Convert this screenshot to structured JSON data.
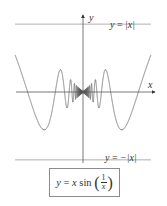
{
  "chart_data": {
    "type": "line",
    "title": "",
    "xlabel": "x",
    "ylabel": "y",
    "grid": false,
    "legend": "none",
    "series": [
      {
        "name": "y = x sin(1/x)",
        "function": "x*sin(1/x)",
        "color": "#666666",
        "style": "solid"
      },
      {
        "name": "y = |x|",
        "function": "abs(x)",
        "color": "#8c8c8c",
        "style": "solid"
      },
      {
        "name": "y = -|x|",
        "function": "-abs(x)",
        "color": "#8c8c8c",
        "style": "solid"
      }
    ],
    "xlim": [
      -0.39,
      0.39
    ],
    "ylim": [
      -0.41,
      0.44
    ],
    "annotations": [
      {
        "text": "y = |x|",
        "position": "upper-right"
      },
      {
        "text": "y = −|x|",
        "position": "lower-right"
      },
      {
        "text": "y = x sin(1/x)",
        "position": "boxed-below-plot"
      }
    ],
    "key_points": [
      {
        "x": -0.318,
        "y": 0.0,
        "note": "zero crossing x=-1/π"
      },
      {
        "x": 0.318,
        "y": 0.0,
        "note": "zero crossing x=1/π"
      },
      {
        "x": -0.212,
        "y": -0.212,
        "note": "touches -|x| at x=-2/(3π)"
      },
      {
        "x": 0.212,
        "y": -0.212,
        "note": "touches -|x| at x=2/(3π)"
      },
      {
        "x": -0.127,
        "y": 0.127,
        "note": "touches |x| at x=-2/(5π)"
      },
      {
        "x": 0.127,
        "y": 0.127,
        "note": "touches |x| at x=2/(5π)"
      }
    ]
  },
  "labels": {
    "x_axis": "x",
    "y_axis": "y",
    "upper_line": {
      "lhs": "y",
      "eq": " = ",
      "rhs": "|x|"
    },
    "lower_line": {
      "lhs": "y",
      "eq": " = ",
      "rhs": "−|x|"
    },
    "formula": {
      "lhs": "y",
      "eq": " = ",
      "x": "x",
      "fn": " sin ",
      "num": "1",
      "den": "x"
    }
  },
  "colors": {
    "curve": "#666666",
    "envelope": "#8c8c8c",
    "axes": "#555555"
  }
}
